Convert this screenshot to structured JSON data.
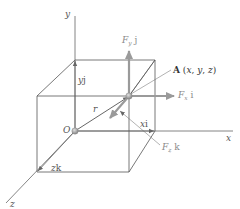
{
  "figure": {
    "axes": {
      "x_label": "x",
      "y_label": "y",
      "z_label": "z"
    },
    "origin_label": "O",
    "point_label": "A (x, y, z)",
    "position_vector_label": "r",
    "components": {
      "x": "xi",
      "y": "yj",
      "z": "zk"
    },
    "forces": {
      "Fx": {
        "symbol": "F",
        "subscript": "x",
        "unit_vector": "i"
      },
      "Fy": {
        "symbol": "F",
        "subscript": "y",
        "unit_vector": "j"
      },
      "Fz": {
        "symbol": "F",
        "subscript": "z",
        "unit_vector": "k"
      }
    },
    "colors": {
      "line": "#555555",
      "force_arrow": "#9a9a9a",
      "point": "#a0a0a0",
      "text": "#555555"
    }
  }
}
